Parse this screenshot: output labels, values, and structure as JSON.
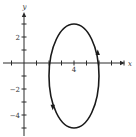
{
  "chart_data": {
    "type": "line",
    "title": "",
    "xlabel": "x",
    "ylabel": "y",
    "xlim": [
      -3,
      9
    ],
    "ylim": [
      -6,
      4
    ],
    "x_ticks": [
      -2,
      -1,
      1,
      2,
      3,
      4,
      5,
      6,
      7,
      8
    ],
    "y_ticks": [
      -5,
      -4,
      -3,
      -2,
      -1,
      1,
      2,
      3
    ],
    "x_tick_labels": [
      {
        "value": 4,
        "label": "4"
      }
    ],
    "y_tick_labels": [
      {
        "value": 2,
        "label": "2"
      },
      {
        "value": -2,
        "label": "−2"
      },
      {
        "value": -4,
        "label": "−4"
      }
    ],
    "grid": false,
    "legend": "none",
    "series": [
      {
        "name": "ellipse",
        "kind": "ellipse",
        "center": [
          4,
          -1
        ],
        "semi_axis_x": 2,
        "semi_axis_y": 4,
        "orientation": "counterclockwise",
        "arrows": [
          {
            "at_point": [
              5.9,
              0.8
            ],
            "direction": "up"
          },
          {
            "at_point": [
              2.3,
              -3.4
            ],
            "direction": "down"
          }
        ]
      }
    ]
  }
}
